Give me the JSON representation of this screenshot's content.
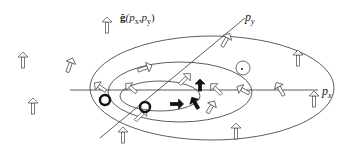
{
  "figure": {
    "type": "pseudospin texture diagram in momentum space",
    "field_label": {
      "symbol": "ĝ",
      "args": "(p",
      "arg1_sub": "x",
      "sep": ",p",
      "arg2_sub": "y",
      "close": ")"
    },
    "axes": {
      "x_label": "p",
      "x_sub": "x",
      "y_label": "p",
      "y_sub": "y"
    },
    "colors": {
      "line": "#333333",
      "arrow_fill": "#ffffff",
      "arrow_stroke": "#444444",
      "dark_arrow": "#111111"
    },
    "ellipses": [
      {
        "name": "outer",
        "cx": 212,
        "cy": 88,
        "rx": 122,
        "ry": 52
      },
      {
        "name": "middle",
        "cx": 180,
        "cy": 92,
        "rx": 72,
        "ry": 30
      },
      {
        "name": "inner",
        "cx": 160,
        "cy": 96,
        "rx": 40,
        "ry": 15
      }
    ],
    "arrows": [
      {
        "x": 107,
        "y": 25,
        "angle": 0,
        "len": 16,
        "dark": false
      },
      {
        "x": 23,
        "y": 60,
        "angle": 0,
        "len": 16,
        "dark": false
      },
      {
        "x": 33,
        "y": 106,
        "angle": 0,
        "len": 16,
        "dark": false
      },
      {
        "x": 70,
        "y": 65,
        "angle": 20,
        "len": 15,
        "dark": false
      },
      {
        "x": 145,
        "y": 68,
        "angle": 70,
        "len": 15,
        "dark": false
      },
      {
        "x": 100,
        "y": 87,
        "angle": -55,
        "len": 14,
        "dark": false
      },
      {
        "x": 131,
        "y": 88,
        "angle": -50,
        "len": 14,
        "dark": false
      },
      {
        "x": 226,
        "y": 40,
        "angle": 30,
        "len": 15,
        "dark": false
      },
      {
        "x": 185,
        "y": 79,
        "angle": 45,
        "len": 15,
        "dark": false
      },
      {
        "x": 298,
        "y": 58,
        "angle": 0,
        "len": 16,
        "dark": false
      },
      {
        "x": 314,
        "y": 99,
        "angle": 0,
        "len": 16,
        "dark": false
      },
      {
        "x": 280,
        "y": 89,
        "angle": -30,
        "len": 15,
        "dark": false
      },
      {
        "x": 216,
        "y": 89,
        "angle": -45,
        "len": 15,
        "dark": false
      },
      {
        "x": 243,
        "y": 90,
        "angle": -60,
        "len": 14,
        "dark": false
      },
      {
        "x": 211,
        "y": 107,
        "angle": 30,
        "len": 14,
        "dark": false
      },
      {
        "x": 236,
        "y": 131,
        "angle": 0,
        "len": 16,
        "dark": false
      },
      {
        "x": 123,
        "y": 135,
        "angle": 0,
        "len": 16,
        "dark": false
      },
      {
        "x": 141,
        "y": 115,
        "angle": 45,
        "len": 16,
        "dark": false
      },
      {
        "x": 177,
        "y": 104,
        "angle": 90,
        "len": 13,
        "dark": true
      },
      {
        "x": 195,
        "y": 103,
        "angle": -30,
        "len": 13,
        "dark": true
      },
      {
        "x": 200,
        "y": 85,
        "angle": 0,
        "len": 12,
        "dark": true
      }
    ],
    "loops": [
      {
        "x": 105,
        "y": 100,
        "r": 5,
        "dark": true
      },
      {
        "x": 145,
        "y": 107,
        "r": 5,
        "dark": true
      },
      {
        "x": 243,
        "y": 68,
        "r": 7,
        "dark": false
      }
    ]
  }
}
